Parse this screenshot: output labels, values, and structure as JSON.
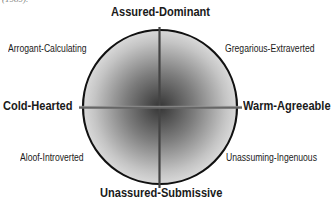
{
  "caption_fragment": "(1989).",
  "diagram": {
    "type": "interpersonal-circumplex",
    "axes": {
      "top": "Assured-Dominant",
      "bottom": "Unassured-Submissive",
      "left": "Cold-Hearted",
      "right": "Warm-Agreeable"
    },
    "quadrants": {
      "top_left": "Arrogant-Calculating",
      "top_right": "Gregarious-Extraverted",
      "bottom_left": "Aloof-Introverted",
      "bottom_right": "Unassuming-Ingenuous"
    },
    "colors": {
      "circle_outline": "#111111",
      "gradient_center": "#3a3a3a",
      "gradient_edge": "#d8d8d8",
      "axis_line": "#5a5a5a"
    }
  }
}
